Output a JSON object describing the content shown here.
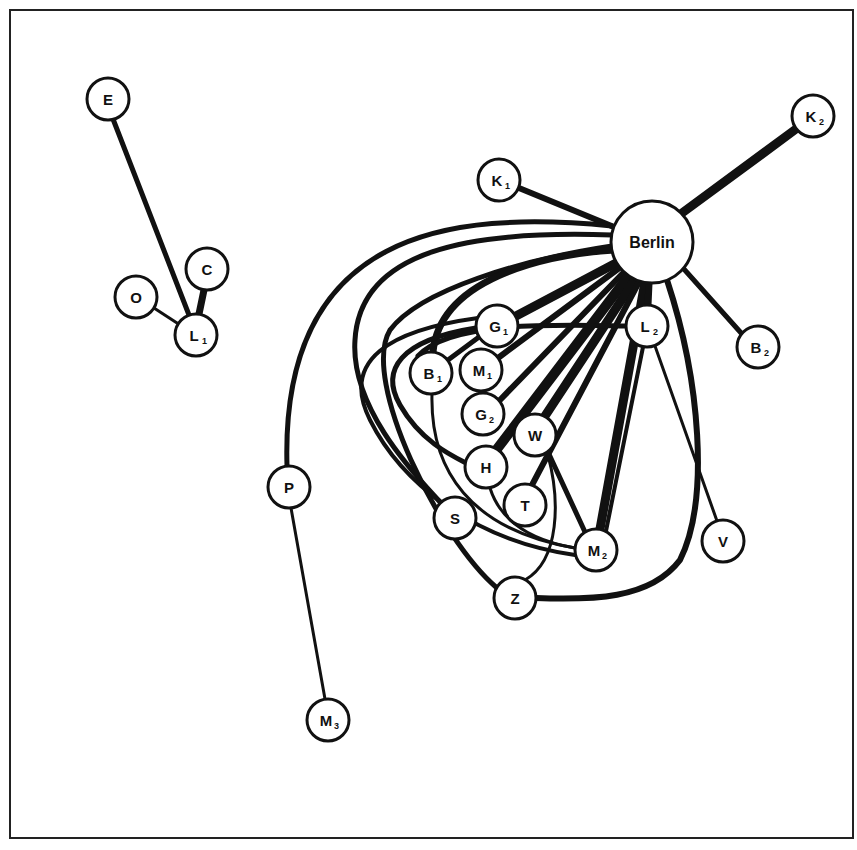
{
  "diagram": {
    "title": "",
    "frame": {
      "x": 10,
      "y": 10,
      "w": 843,
      "h": 828
    },
    "nodes": [
      {
        "id": "E",
        "label": "E",
        "sub": "",
        "x": 108,
        "y": 99,
        "r": 21
      },
      {
        "id": "C",
        "label": "C",
        "sub": "",
        "x": 207,
        "y": 269,
        "r": 21
      },
      {
        "id": "O",
        "label": "O",
        "sub": "",
        "x": 136,
        "y": 297,
        "r": 21
      },
      {
        "id": "L1",
        "label": "L",
        "sub": "1",
        "x": 196,
        "y": 335,
        "r": 21
      },
      {
        "id": "Berlin",
        "label": "Berlin",
        "sub": "",
        "x": 652,
        "y": 242,
        "r": 41
      },
      {
        "id": "K1",
        "label": "K",
        "sub": "1",
        "x": 499,
        "y": 180,
        "r": 21
      },
      {
        "id": "K2",
        "label": "K",
        "sub": "2",
        "x": 813,
        "y": 116,
        "r": 21
      },
      {
        "id": "B2",
        "label": "B",
        "sub": "2",
        "x": 758,
        "y": 347,
        "r": 21
      },
      {
        "id": "G1",
        "label": "G",
        "sub": "1",
        "x": 497,
        "y": 326,
        "r": 21
      },
      {
        "id": "L2",
        "label": "L",
        "sub": "2",
        "x": 647,
        "y": 326,
        "r": 21
      },
      {
        "id": "B1",
        "label": "B",
        "sub": "1",
        "x": 431,
        "y": 373,
        "r": 21
      },
      {
        "id": "M1",
        "label": "M",
        "sub": "1",
        "x": 481,
        "y": 370,
        "r": 21
      },
      {
        "id": "G2",
        "label": "G",
        "sub": "2",
        "x": 483,
        "y": 414,
        "r": 21
      },
      {
        "id": "W",
        "label": "W",
        "sub": "",
        "x": 535,
        "y": 435,
        "r": 21
      },
      {
        "id": "H",
        "label": "H",
        "sub": "",
        "x": 486,
        "y": 467,
        "r": 21
      },
      {
        "id": "T",
        "label": "T",
        "sub": "",
        "x": 525,
        "y": 505,
        "r": 21
      },
      {
        "id": "S",
        "label": "S",
        "sub": "",
        "x": 455,
        "y": 518,
        "r": 21
      },
      {
        "id": "V",
        "label": "V",
        "sub": "",
        "x": 723,
        "y": 541,
        "r": 21
      },
      {
        "id": "M2",
        "label": "M",
        "sub": "2",
        "x": 596,
        "y": 550,
        "r": 21
      },
      {
        "id": "Z",
        "label": "Z",
        "sub": "",
        "x": 515,
        "y": 598,
        "r": 21
      },
      {
        "id": "P",
        "label": "P",
        "sub": "",
        "x": 289,
        "y": 487,
        "r": 21
      },
      {
        "id": "M3",
        "label": "M",
        "sub": "3",
        "x": 328,
        "y": 720,
        "r": 21
      }
    ],
    "edges": [
      {
        "from": "E",
        "to": "L1",
        "w": 5,
        "path": "M113,119 L189,315"
      },
      {
        "from": "C",
        "to": "L1",
        "w": 7,
        "path": "M204,290 L199,314"
      },
      {
        "from": "O",
        "to": "L1",
        "w": 3,
        "path": "M154,308 L177,323"
      },
      {
        "from": "Berlin",
        "to": "K1",
        "w": 6,
        "path": "M614,227 L519,188"
      },
      {
        "from": "Berlin",
        "to": "K2",
        "w": 9,
        "path": "M682,213 L796,129"
      },
      {
        "from": "Berlin",
        "to": "B2",
        "w": 5,
        "path": "M683,268 L742,334"
      },
      {
        "from": "Berlin",
        "to": "P",
        "w": 5,
        "path": "M612,226 C450,210 280,230 287,466"
      },
      {
        "from": "Berlin",
        "to": "S",
        "w": 5,
        "path": "M612,235 C470,230 360,250 355,340 C350,410 420,480 440,502"
      },
      {
        "from": "Berlin",
        "to": "Z",
        "w": 5,
        "path": "M612,246 C520,260 420,290 390,330 C360,380 440,540 497,588"
      },
      {
        "from": "Berlin",
        "to": "B1",
        "w": 7,
        "path": "M614,250 C540,255 440,280 433,352"
      },
      {
        "from": "Berlin",
        "to": "G1",
        "w": 9,
        "path": "M618,262 L516,316"
      },
      {
        "from": "Berlin",
        "to": "M1",
        "w": 6,
        "path": "M622,266 L498,358"
      },
      {
        "from": "Berlin",
        "to": "G2",
        "w": 6,
        "path": "M626,270 L500,400"
      },
      {
        "from": "Berlin",
        "to": "H",
        "w": 10,
        "path": "M630,274 L497,449"
      },
      {
        "from": "Berlin",
        "to": "W",
        "w": 9,
        "path": "M636,278 L545,416"
      },
      {
        "from": "Berlin",
        "to": "T",
        "w": 6,
        "path": "M640,280 L532,485"
      },
      {
        "from": "Berlin",
        "to": "M2",
        "w": 9,
        "path": "M645,282 L600,529"
      },
      {
        "from": "Berlin",
        "to": "L2",
        "w": 7,
        "path": "M649,283 L648,305"
      },
      {
        "from": "Berlin",
        "to": "Z",
        "w": 6,
        "path": "M667,280 C700,380 710,500 680,560 C650,600 590,600 536,598"
      },
      {
        "from": "B1",
        "to": "L2",
        "w": 5,
        "path": "M418,356 C450,320 560,325 626,326"
      },
      {
        "from": "B1",
        "to": "G1",
        "w": 5,
        "path": "M448,360 L479,337"
      },
      {
        "from": "G1",
        "to": "H",
        "w": 5,
        "path": "M476,328 C400,340 380,370 400,405 C420,440 450,455 466,463"
      },
      {
        "from": "B1",
        "to": "M2",
        "w": 3,
        "path": "M432,394 C430,470 470,530 575,548"
      },
      {
        "from": "G1",
        "to": "M2",
        "w": 4,
        "path": "M478,318 C390,330 340,360 370,420 C400,480 470,540 575,555"
      },
      {
        "from": "H",
        "to": "M2",
        "w": 3,
        "path": "M490,488 C500,520 530,540 575,548"
      },
      {
        "from": "W",
        "to": "M2",
        "w": 5,
        "path": "M548,452 L585,532"
      },
      {
        "from": "W",
        "to": "Z",
        "w": 3,
        "path": "M548,455 C560,500 560,560 525,580"
      },
      {
        "from": "L2",
        "to": "M2",
        "w": 4,
        "path": "M643,347 L606,531"
      },
      {
        "from": "L2",
        "to": "V",
        "w": 3,
        "path": "M655,346 L717,521"
      },
      {
        "from": "P",
        "to": "M3",
        "w": 3,
        "path": "M291,508 L325,699"
      }
    ]
  }
}
